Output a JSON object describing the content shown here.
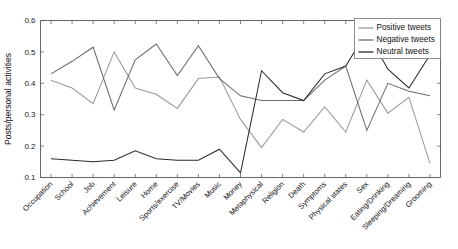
{
  "chart_data": {
    "type": "line",
    "title": "",
    "xlabel": "",
    "ylabel": "Posts/personal activities",
    "ylim": [
      0.1,
      0.6
    ],
    "yticks": [
      "0.1",
      "0.2",
      "0.3",
      "0.4",
      "0.5",
      "0.6"
    ],
    "grid": false,
    "legend_position": "top-right",
    "categories": [
      "Occupation",
      "School",
      "Job",
      "Achievement",
      "Leisure",
      "Home",
      "Sports/exercise",
      "TV/Movies",
      "Music",
      "Money",
      "Metaphysical",
      "Religion",
      "Death",
      "Symptoms",
      "Physical states",
      "Sex",
      "Eating/Drinking",
      "Sleeping/Dreaming",
      "Grooming"
    ],
    "series": [
      {
        "name": "Positive tweets",
        "color": "#9a9a9a",
        "values": [
          0.41,
          0.385,
          0.335,
          0.5,
          0.385,
          0.365,
          0.32,
          0.415,
          0.42,
          0.285,
          0.195,
          0.285,
          0.245,
          0.325,
          0.245,
          0.41,
          0.305,
          0.355,
          0.145
        ]
      },
      {
        "name": "Negative tweets",
        "color": "#6b6b6b",
        "values": [
          0.43,
          0.47,
          0.515,
          0.315,
          0.475,
          0.525,
          0.425,
          0.52,
          0.415,
          0.36,
          0.345,
          0.345,
          0.345,
          0.41,
          0.455,
          0.25,
          0.4,
          0.375,
          0.36
        ]
      },
      {
        "name": "Neutral tweets",
        "color": "#2b2b2b",
        "values": [
          0.16,
          0.155,
          0.15,
          0.155,
          0.185,
          0.16,
          0.155,
          0.155,
          0.19,
          0.115,
          0.44,
          0.37,
          0.345,
          0.43,
          0.455,
          0.565,
          0.445,
          0.385,
          0.49
        ]
      }
    ]
  },
  "legend": {
    "entries": [
      {
        "label": "Positive tweets"
      },
      {
        "label": "Negative tweets"
      },
      {
        "label": "Neutral tweets"
      }
    ]
  }
}
